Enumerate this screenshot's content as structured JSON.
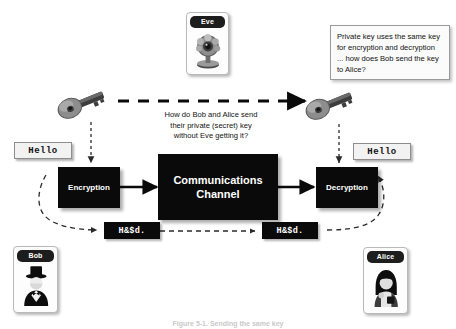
{
  "figure": {
    "caption": "Figure 5-1. Sending the same key"
  },
  "eve_card": {
    "title": "Eve",
    "icon": "spy-webcam-icon"
  },
  "bob_card": {
    "title": "Bob",
    "icon": "man-tophat-avatar-icon"
  },
  "alice_card": {
    "title": "Alice",
    "icon": "woman-avatar-icon"
  },
  "note": {
    "text": "Private key uses the same key for encryption and decryption ...  how does Bob send the key to Alice?"
  },
  "question": {
    "line1": "How do Bob and Alice send",
    "line2": "their private (secret) key",
    "line3": "without Eve getting it?"
  },
  "keys": {
    "left_icon": "key-icon",
    "right_icon": "key-icon"
  },
  "flow": {
    "plaintext_left": "Hello",
    "plaintext_right": "Hello",
    "encryption": "Encryption",
    "channel_line1": "Communications",
    "channel_line2": "Channel",
    "decryption": "Decryption",
    "cipher_left": "H&$d.",
    "cipher_right": "H&$d."
  },
  "colors": {
    "box_black": "#0a0a0a",
    "text_white": "#ffffff",
    "plain_bg": "#f2f2f2",
    "note_bg": "#fbfbfb",
    "border_gray": "#8d8d8d",
    "page_bg": "#ffffff"
  }
}
